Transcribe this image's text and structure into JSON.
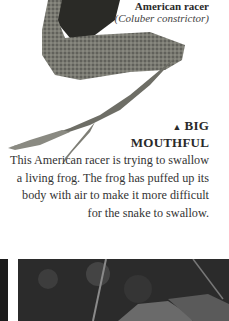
{
  "caption": {
    "name": "American racer",
    "latin": "(Coluber constrictor)"
  },
  "feature": {
    "icon": "triangle-up-icon",
    "icon_glyph": "▲",
    "title_line1": "BIG",
    "title_line2": "MOUTHFUL",
    "body": "This American racer is trying to swallow a living frog. The frog has puffed up its body with air to make it more difficult for the snake to swallow."
  }
}
